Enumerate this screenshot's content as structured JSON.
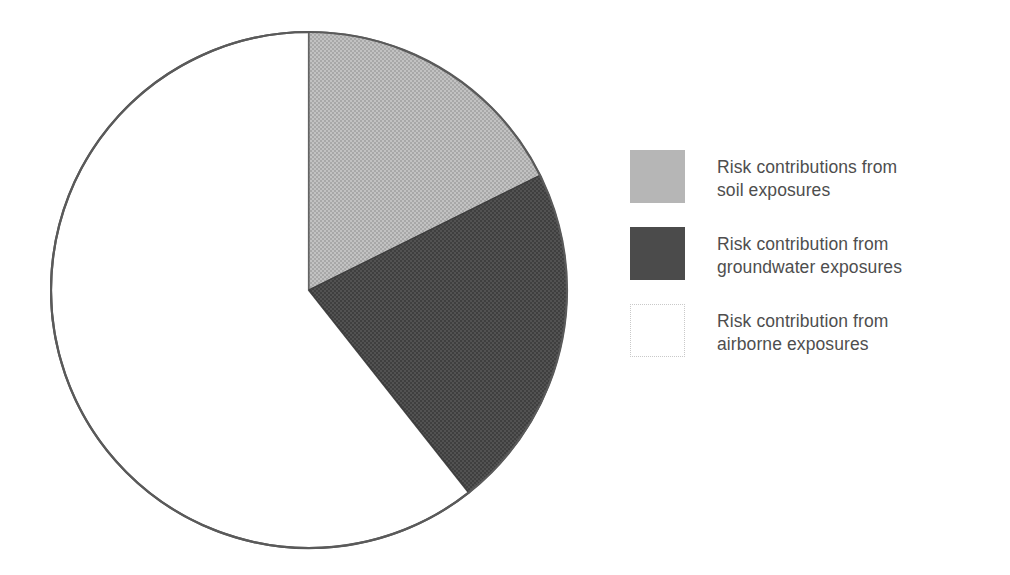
{
  "figure": {
    "title": "",
    "background_color": "#ffffff"
  },
  "chart_data": {
    "type": "pie",
    "title": "",
    "xlabel": "",
    "ylabel": "",
    "grid": false,
    "legend_position": "right",
    "start_angle_deg": 0,
    "direction": "clockwise",
    "categories": [
      "Risk contributions from soil exposures",
      "Risk contribution from groundwater exposures",
      "Risk contribution from airborne exposures"
    ],
    "values": [
      17.7,
      21.7,
      60.6
    ],
    "units": "percent",
    "slices": [
      {
        "label": "Risk contributions from soil exposures",
        "short_label": "soil exposures",
        "value": 17.7,
        "angle_deg": 63.6,
        "start_angle_deg": 0.0,
        "end_angle_deg": 63.6,
        "color": "#b6b6b6",
        "edge_color": "#555555"
      },
      {
        "label": "Risk contribution from groundwater exposures",
        "short_label": "groundwater exposures",
        "value": 21.7,
        "angle_deg": 78.1,
        "start_angle_deg": 63.6,
        "end_angle_deg": 141.7,
        "color": "#4b4b4b",
        "edge_color": "#444444"
      },
      {
        "label": "Risk contribution from airborne exposures",
        "short_label": "airborne exposures",
        "value": 60.6,
        "angle_deg": 218.3,
        "start_angle_deg": 141.7,
        "end_angle_deg": 360.0,
        "color": "#ffffff",
        "edge_color": "#555555"
      }
    ]
  },
  "legend": {
    "items": [
      {
        "label": "Risk contributions from\nsoil exposures",
        "swatch_color": "#b6b6b6",
        "swatch_style": "filled-light"
      },
      {
        "label": "Risk contribution from\ngroundwater exposures",
        "swatch_color": "#4b4b4b",
        "swatch_style": "filled-dark"
      },
      {
        "label": "Risk contribution from\nairborne exposures",
        "swatch_color": "#ffffff",
        "swatch_style": "outline-white"
      }
    ]
  },
  "colors": {
    "soil": "#b6b6b6",
    "groundwater": "#4b4b4b",
    "airborne": "#ffffff",
    "outline": "#555555",
    "text": "#4e4e4e"
  }
}
